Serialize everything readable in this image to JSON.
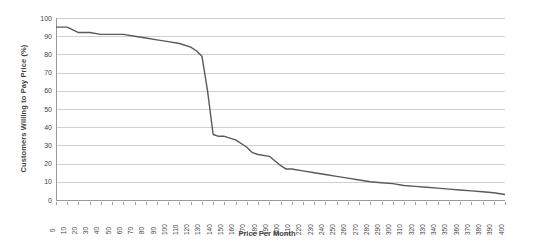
{
  "chart_data": {
    "type": "line",
    "title": "",
    "xlabel": "Price Per Month",
    "ylabel": "Customers Willing to Pay Price (%)",
    "xlim": [
      0,
      400
    ],
    "ylim": [
      0,
      100
    ],
    "xtick_step": 10,
    "ytick_step": 10,
    "grid": true,
    "legend": false,
    "line_color": "#595959",
    "grid_color": "#d0d0d0",
    "axis_color": "#9a9a9a",
    "background": "#ffffff",
    "xticks": [
      "0",
      "10",
      "20",
      "30",
      "40",
      "50",
      "60",
      "70",
      "80",
      "90",
      "100",
      "110",
      "120",
      "130",
      "140",
      "150",
      "160",
      "170",
      "180",
      "190",
      "200",
      "210",
      "220",
      "230",
      "240",
      "250",
      "260",
      "270",
      "280",
      "290",
      "300",
      "310",
      "320",
      "330",
      "340",
      "350",
      "360",
      "370",
      "380",
      "390",
      "400"
    ],
    "yticks": [
      "0",
      "10",
      "20",
      "30",
      "40",
      "50",
      "60",
      "70",
      "80",
      "90",
      "100"
    ],
    "series": [
      {
        "name": "Customers Willing to Pay Price",
        "x": [
          0,
          10,
          20,
          30,
          40,
          50,
          60,
          70,
          80,
          90,
          100,
          110,
          120,
          125,
          130,
          135,
          140,
          145,
          150,
          160,
          170,
          175,
          180,
          190,
          200,
          205,
          210,
          220,
          230,
          240,
          250,
          260,
          270,
          280,
          290,
          300,
          310,
          320,
          330,
          340,
          350,
          360,
          370,
          380,
          390,
          400
        ],
        "values": [
          95,
          95,
          92,
          92,
          91,
          91,
          91,
          90,
          89,
          88,
          87,
          86,
          84,
          82,
          79,
          60,
          36,
          35,
          35,
          33,
          29,
          26,
          25,
          24,
          19,
          17,
          17,
          16,
          15,
          14,
          13,
          12,
          11,
          10,
          9.5,
          9,
          8,
          7.5,
          7,
          6.5,
          6,
          5.5,
          5,
          4.5,
          4,
          3
        ]
      }
    ]
  }
}
